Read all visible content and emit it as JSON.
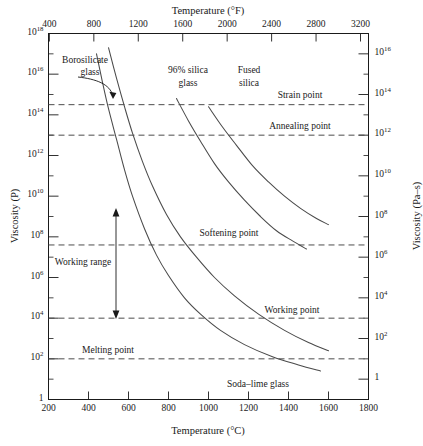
{
  "chart_data": {
    "type": "line",
    "title": "",
    "xlabel": "Temperature (°C)",
    "xlabel_top": "Temperature (°F)",
    "ylabel": "Viscosity (P)",
    "ylabel_right": "Viscosity (Pa–s)",
    "xlim": [
      200,
      1800
    ],
    "xticks": [
      200,
      400,
      600,
      800,
      1000,
      1200,
      1400,
      1600,
      1800
    ],
    "xticklabels": [
      "200",
      "400",
      "600",
      "800",
      "1000",
      "1200",
      "1400",
      "1600",
      "1800"
    ],
    "xlim_top_F": [
      392,
      3272
    ],
    "xticks_top_F": [
      400,
      800,
      1200,
      1600,
      2000,
      2400,
      2800,
      3200
    ],
    "xticklabels_top": [
      "400",
      "800",
      "1200",
      "1600",
      "2000",
      "2400",
      "2800",
      "3200"
    ],
    "ylim_log10": [
      0,
      18
    ],
    "yticks_log10": [
      0,
      2,
      4,
      6,
      8,
      10,
      12,
      14,
      16,
      18
    ],
    "yticklabels": [
      "1",
      "10^2",
      "10^4",
      "10^6",
      "10^8",
      "10^10",
      "10^12",
      "10^14",
      "10^16",
      "10^18"
    ],
    "yticklabels_right": [
      "1",
      "10^2",
      "10^4",
      "10^6",
      "10^8",
      "10^10",
      "10^12",
      "10^14",
      "10^16"
    ],
    "yticks_right_log10_P": [
      1,
      3,
      5,
      7,
      9,
      11,
      13,
      15,
      17
    ],
    "y_minor_log10": [
      1,
      3,
      5,
      7,
      9,
      11,
      13,
      15,
      17
    ],
    "grid": false,
    "legend": "none",
    "reference_lines": [
      {
        "name": "Strain point",
        "y_log10": 14.5,
        "label": "Strain point",
        "style": "dashed"
      },
      {
        "name": "Annealing point",
        "y_log10": 13.0,
        "label": "Annealing point",
        "style": "dashed"
      },
      {
        "name": "Softening point",
        "y_log10": 7.6,
        "label": "Softening point",
        "style": "dashed"
      },
      {
        "name": "Working point",
        "y_log10": 4.0,
        "label": "Working point",
        "style": "dashed"
      },
      {
        "name": "Melting point",
        "y_log10": 2.0,
        "label": "Melting point",
        "style": "dashed"
      }
    ],
    "annotations": [
      {
        "text": "Borosilicate glass",
        "kind": "curve-label-with-arrow"
      },
      {
        "text": "96% silica glass",
        "kind": "curve-label"
      },
      {
        "text": "Fused silica",
        "kind": "curve-label"
      },
      {
        "text": "Soda–lime glass",
        "kind": "curve-label"
      },
      {
        "text": "Working range",
        "kind": "range-label-with-double-arrow",
        "from_y_log10": 7.6,
        "to_y_log10": 4.0
      }
    ],
    "series": [
      {
        "name": "Soda–lime glass",
        "points": [
          [
            440,
            17.0
          ],
          [
            470,
            15.6
          ],
          [
            500,
            14.3
          ],
          [
            540,
            12.8
          ],
          [
            580,
            11.3
          ],
          [
            620,
            10.0
          ],
          [
            680,
            8.4
          ],
          [
            740,
            7.1
          ],
          [
            800,
            6.1
          ],
          [
            880,
            5.0
          ],
          [
            960,
            4.2
          ],
          [
            1060,
            3.4
          ],
          [
            1180,
            2.7
          ],
          [
            1320,
            2.1
          ],
          [
            1450,
            1.7
          ],
          [
            1560,
            1.4
          ]
        ]
      },
      {
        "name": "Borosilicate glass",
        "points": [
          [
            500,
            17.3
          ],
          [
            540,
            15.8
          ],
          [
            580,
            14.4
          ],
          [
            620,
            13.1
          ],
          [
            670,
            11.7
          ],
          [
            720,
            10.5
          ],
          [
            790,
            9.1
          ],
          [
            860,
            8.0
          ],
          [
            940,
            7.0
          ],
          [
            1030,
            6.0
          ],
          [
            1130,
            5.1
          ],
          [
            1250,
            4.2
          ],
          [
            1380,
            3.4
          ],
          [
            1500,
            2.8
          ],
          [
            1600,
            2.4
          ]
        ]
      },
      {
        "name": "96% silica glass",
        "points": [
          [
            840,
            14.8
          ],
          [
            900,
            13.7
          ],
          [
            960,
            12.7
          ],
          [
            1030,
            11.6
          ],
          [
            1100,
            10.7
          ],
          [
            1180,
            9.8
          ],
          [
            1260,
            9.0
          ],
          [
            1340,
            8.3
          ],
          [
            1420,
            7.8
          ],
          [
            1490,
            7.4
          ]
        ]
      },
      {
        "name": "Fused silica",
        "points": [
          [
            1000,
            14.4
          ],
          [
            1070,
            13.4
          ],
          [
            1140,
            12.5
          ],
          [
            1220,
            11.5
          ],
          [
            1300,
            10.7
          ],
          [
            1380,
            10.0
          ],
          [
            1460,
            9.4
          ],
          [
            1540,
            8.9
          ],
          [
            1600,
            8.6
          ]
        ]
      }
    ]
  },
  "axes": {
    "top_title": "Temperature (°F)",
    "bottom_title": "Temperature (°C)",
    "left_title": "Viscosity (P)",
    "right_title": "Viscosity (Pa–s)"
  },
  "ticks": {
    "top": [
      "400",
      "800",
      "1200",
      "1600",
      "2000",
      "2400",
      "2800",
      "3200"
    ],
    "bottom": [
      "200",
      "400",
      "600",
      "800",
      "1000",
      "1200",
      "1400",
      "1600",
      "1800"
    ],
    "left": [
      {
        "mantissa": "10",
        "exp": "18"
      },
      {
        "mantissa": "10",
        "exp": "16"
      },
      {
        "mantissa": "10",
        "exp": "14"
      },
      {
        "mantissa": "10",
        "exp": "12"
      },
      {
        "mantissa": "10",
        "exp": "10"
      },
      {
        "mantissa": "10",
        "exp": "8"
      },
      {
        "mantissa": "10",
        "exp": "6"
      },
      {
        "mantissa": "10",
        "exp": "4"
      },
      {
        "mantissa": "10",
        "exp": "2"
      },
      {
        "mantissa": "1",
        "exp": ""
      }
    ],
    "right": [
      {
        "mantissa": "10",
        "exp": "16"
      },
      {
        "mantissa": "10",
        "exp": "14"
      },
      {
        "mantissa": "10",
        "exp": "12"
      },
      {
        "mantissa": "10",
        "exp": "10"
      },
      {
        "mantissa": "10",
        "exp": "8"
      },
      {
        "mantissa": "10",
        "exp": "6"
      },
      {
        "mantissa": "10",
        "exp": "4"
      },
      {
        "mantissa": "10",
        "exp": "2"
      },
      {
        "mantissa": "1",
        "exp": ""
      }
    ]
  },
  "labels": {
    "borosilicate_l1": "Borosilicate",
    "borosilicate_l2": "glass",
    "silica96_l1": "96% silica",
    "silica96_l2": "glass",
    "fused_l1": "Fused",
    "fused_l2": "silica",
    "sodalime": "Soda–lime glass",
    "strain": "Strain point",
    "annealing": "Annealing point",
    "softening": "Softening point",
    "working_point": "Working point",
    "melting": "Melting point",
    "working_range": "Working range"
  },
  "colors": {
    "ink": "#1a1a1a",
    "curve": "#4a4a4a",
    "dashed": "#555555",
    "background": "#ffffff"
  }
}
